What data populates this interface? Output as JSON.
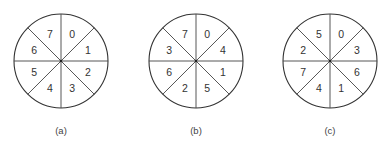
{
  "figure": {
    "type": "sector-disk-diagrams",
    "sector_order_note": "Labels listed clockwise starting from top-right sector",
    "disks": [
      {
        "caption": "(a)",
        "labels_clockwise_from_top_right": [
          "0",
          "1",
          "2",
          "3",
          "4",
          "5",
          "6",
          "7"
        ]
      },
      {
        "caption": "(b)",
        "labels_clockwise_from_top_right": [
          "0",
          "4",
          "1",
          "5",
          "2",
          "6",
          "3",
          "7"
        ]
      },
      {
        "caption": "(c)",
        "labels_clockwise_from_top_right": [
          "0",
          "3",
          "6",
          "1",
          "4",
          "7",
          "2",
          "5"
        ]
      }
    ]
  }
}
